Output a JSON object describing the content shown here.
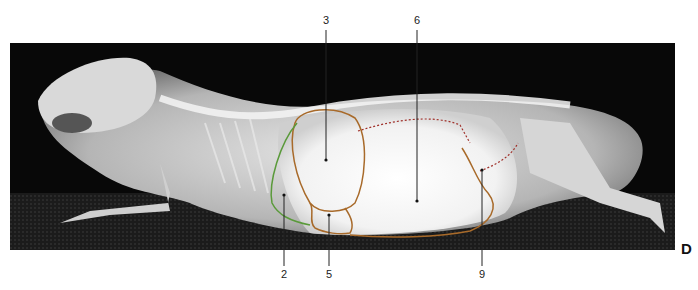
{
  "figure": {
    "panel_letter": "D",
    "labels": [
      {
        "id": "label-3",
        "text": "3",
        "x": 326,
        "y": 24
      },
      {
        "id": "label-6",
        "text": "6",
        "x": 417,
        "y": 24
      },
      {
        "id": "label-2",
        "text": "2",
        "x": 284,
        "y": 278
      },
      {
        "id": "label-5",
        "text": "5",
        "x": 329,
        "y": 278
      },
      {
        "id": "label-9",
        "text": "9",
        "x": 482,
        "y": 278
      }
    ],
    "outline_colors": {
      "organ_outline": "#a86a2a",
      "boundary_green": "#5a9a3a",
      "dotted_outline": "#a0302a",
      "leader_line": "#222222"
    }
  }
}
